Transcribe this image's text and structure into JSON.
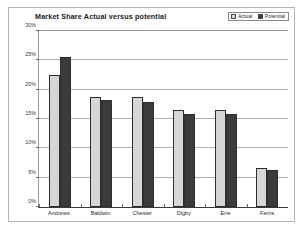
{
  "chart_data": {
    "type": "bar",
    "title": "Market Share Actual versus potential",
    "xlabel": "",
    "ylabel": "",
    "categories": [
      "Andrews",
      "Baldwin",
      "Chester",
      "Digby",
      "Erie",
      "Ferris"
    ],
    "series": [
      {
        "name": "Actual",
        "color": "#d6d6d6",
        "values": [
          22.5,
          18.8,
          18.7,
          16.5,
          16.5,
          6.6
        ]
      },
      {
        "name": "Potential",
        "color": "#3b3b3b",
        "values": [
          25.5,
          18.2,
          17.9,
          15.9,
          15.9,
          6.3
        ]
      }
    ],
    "ylim": [
      0,
      30
    ],
    "ytick_values": [
      0,
      5,
      10,
      15,
      20,
      25,
      30
    ],
    "ytick_labels": [
      "0%",
      "5%",
      "10%",
      "15%",
      "20%",
      "25%",
      "30%"
    ],
    "grid": true,
    "legend_position": "top-right",
    "value_suffix": "%"
  }
}
